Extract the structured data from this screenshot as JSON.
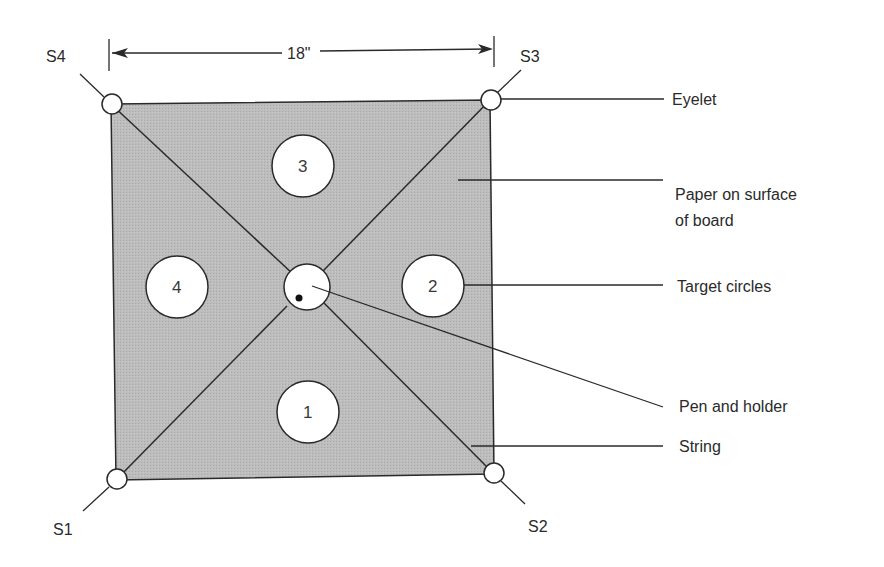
{
  "diagram": {
    "type": "labeled-schematic",
    "colors": {
      "board_fill": "#b9b9b9",
      "line": "#2a2a2a",
      "circle_fill": "#ffffff",
      "background": "#ffffff"
    },
    "dimension": {
      "label": "18\"",
      "from": "S4",
      "to": "S3"
    },
    "corners": [
      {
        "id": "S1",
        "label": "S1",
        "position": "bottom-left"
      },
      {
        "id": "S2",
        "label": "S2",
        "position": "bottom-right"
      },
      {
        "id": "S3",
        "label": "S3",
        "position": "top-right"
      },
      {
        "id": "S4",
        "label": "S4",
        "position": "top-left"
      }
    ],
    "target_circles": [
      {
        "id": "1",
        "label": "1",
        "position": "bottom"
      },
      {
        "id": "2",
        "label": "2",
        "position": "right"
      },
      {
        "id": "3",
        "label": "3",
        "position": "top"
      },
      {
        "id": "4",
        "label": "4",
        "position": "left"
      }
    ],
    "callouts": [
      {
        "id": "eyelet",
        "label": "Eyelet"
      },
      {
        "id": "paper",
        "label_line1": "Paper on surface",
        "label_line2": "of board"
      },
      {
        "id": "target",
        "label": "Target circles"
      },
      {
        "id": "pen",
        "label": "Pen and holder"
      },
      {
        "id": "string",
        "label": "String"
      }
    ]
  }
}
